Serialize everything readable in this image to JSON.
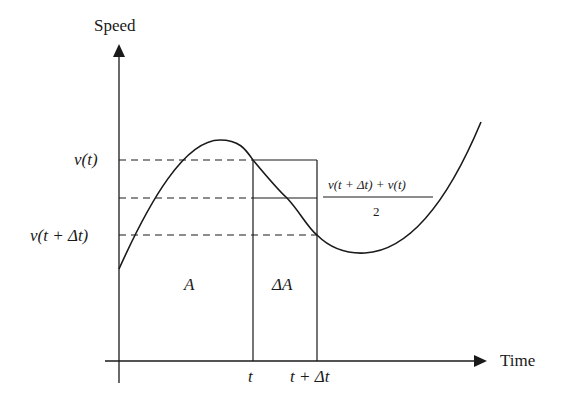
{
  "diagram": {
    "title": "",
    "axes": {
      "y_label": "Speed",
      "x_label": "Time"
    },
    "y_labels": {
      "v_t": "v(t)",
      "v_t_dt": "v(t + Δt)"
    },
    "x_ticks": {
      "t": "t",
      "t_dt": "t + Δt"
    },
    "regions": {
      "area_A": "A",
      "area_delta_A": "ΔA"
    },
    "average_formula": {
      "numerator": "v(t + Δt) + v(t)",
      "denominator": "2"
    },
    "colors": {
      "stroke": "#1a1a1a",
      "background": "#ffffff"
    }
  }
}
